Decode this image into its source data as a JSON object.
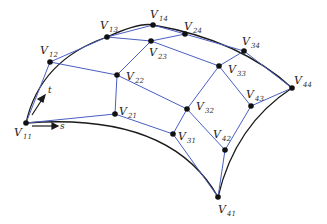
{
  "diagram": {
    "type": "bezier-surface-control-net",
    "colors": {
      "net": "#4a5fc1",
      "curve": "#1a1a1a",
      "point": "#111111"
    },
    "points": [
      {
        "id": "V11",
        "name": "V",
        "sub": "11",
        "x": 26,
        "y": 123,
        "lx": 14,
        "ly": 136
      },
      {
        "id": "V12",
        "name": "V",
        "sub": "12",
        "x": 50,
        "y": 62,
        "lx": 40,
        "ly": 54
      },
      {
        "id": "V13",
        "name": "V",
        "sub": "13",
        "x": 107,
        "y": 37,
        "lx": 100,
        "ly": 29
      },
      {
        "id": "V14",
        "name": "V",
        "sub": "14",
        "x": 153,
        "y": 25,
        "lx": 150,
        "ly": 18
      },
      {
        "id": "V21",
        "name": "V",
        "sub": "21",
        "x": 115,
        "y": 114,
        "lx": 119,
        "ly": 115
      },
      {
        "id": "V22",
        "name": "V",
        "sub": "22",
        "x": 117,
        "y": 75,
        "lx": 126,
        "ly": 80
      },
      {
        "id": "V23",
        "name": "V",
        "sub": "23",
        "x": 151,
        "y": 41,
        "lx": 149,
        "ly": 56
      },
      {
        "id": "V24",
        "name": "V",
        "sub": "24",
        "x": 185,
        "y": 34,
        "lx": 184,
        "ly": 30
      },
      {
        "id": "V31",
        "name": "V",
        "sub": "31",
        "x": 173,
        "y": 134,
        "lx": 178,
        "ly": 140
      },
      {
        "id": "V32",
        "name": "V",
        "sub": "32",
        "x": 187,
        "y": 109,
        "lx": 196,
        "ly": 110
      },
      {
        "id": "V33",
        "name": "V",
        "sub": "33",
        "x": 219,
        "y": 66,
        "lx": 228,
        "ly": 73
      },
      {
        "id": "V34",
        "name": "V",
        "sub": "34",
        "x": 244,
        "y": 51,
        "lx": 242,
        "ly": 45
      },
      {
        "id": "V41",
        "name": "V",
        "sub": "41",
        "x": 218,
        "y": 197,
        "lx": 218,
        "ly": 213
      },
      {
        "id": "V42",
        "name": "V",
        "sub": "42",
        "x": 225,
        "y": 150,
        "lx": 213,
        "ly": 138
      },
      {
        "id": "V43",
        "name": "V",
        "sub": "43",
        "x": 251,
        "y": 106,
        "lx": 246,
        "ly": 98
      },
      {
        "id": "V44",
        "name": "V",
        "sub": "44",
        "x": 292,
        "y": 88,
        "lx": 294,
        "ly": 84
      }
    ],
    "axes": [
      {
        "label": "t",
        "x": 33,
        "y": 95
      },
      {
        "label": "s",
        "x": 60,
        "y": 127
      }
    ]
  }
}
